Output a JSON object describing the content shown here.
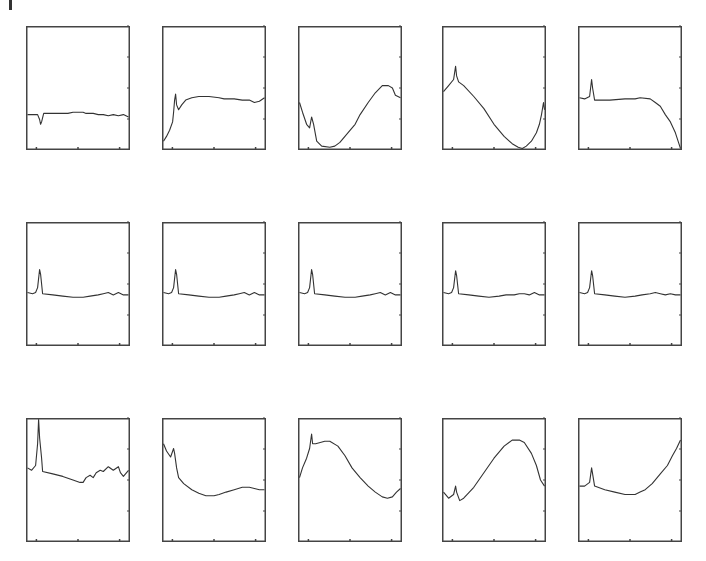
{
  "chart_data": {
    "type": "line",
    "title": "",
    "layout": {
      "rows": 3,
      "cols": 5,
      "grid": false,
      "legend": "none"
    },
    "xlabel": "",
    "ylabel": "",
    "xlim": [
      0,
      1
    ],
    "ylim": [
      0,
      1
    ],
    "x_ticks": [
      0.1,
      0.5,
      0.9
    ],
    "y_ticks_right": [
      0.25,
      0.5,
      0.75,
      1.0
    ],
    "line_color": "#333333",
    "frame_color": "#444444",
    "panels": [
      {
        "row": 0,
        "col": 0,
        "points": [
          [
            0,
            0.28
          ],
          [
            0.06,
            0.28
          ],
          [
            0.1,
            0.28
          ],
          [
            0.12,
            0.24
          ],
          [
            0.13,
            0.2
          ],
          [
            0.14,
            0.22
          ],
          [
            0.16,
            0.29
          ],
          [
            0.3,
            0.29
          ],
          [
            0.4,
            0.29
          ],
          [
            0.45,
            0.3
          ],
          [
            0.5,
            0.3
          ],
          [
            0.55,
            0.3
          ],
          [
            0.58,
            0.29
          ],
          [
            0.65,
            0.29
          ],
          [
            0.7,
            0.28
          ],
          [
            0.75,
            0.28
          ],
          [
            0.8,
            0.27
          ],
          [
            0.85,
            0.28
          ],
          [
            0.9,
            0.27
          ],
          [
            0.95,
            0.28
          ],
          [
            1,
            0.26
          ]
        ]
      },
      {
        "row": 0,
        "col": 1,
        "points": [
          [
            0,
            0.06
          ],
          [
            0.03,
            0.1
          ],
          [
            0.06,
            0.15
          ],
          [
            0.09,
            0.22
          ],
          [
            0.1,
            0.3
          ],
          [
            0.11,
            0.4
          ],
          [
            0.12,
            0.45
          ],
          [
            0.13,
            0.36
          ],
          [
            0.15,
            0.32
          ],
          [
            0.18,
            0.36
          ],
          [
            0.22,
            0.4
          ],
          [
            0.28,
            0.42
          ],
          [
            0.35,
            0.43
          ],
          [
            0.45,
            0.43
          ],
          [
            0.55,
            0.42
          ],
          [
            0.6,
            0.41
          ],
          [
            0.7,
            0.41
          ],
          [
            0.78,
            0.4
          ],
          [
            0.85,
            0.4
          ],
          [
            0.9,
            0.38
          ],
          [
            0.95,
            0.39
          ],
          [
            1,
            0.42
          ]
        ]
      },
      {
        "row": 0,
        "col": 2,
        "points": [
          [
            0,
            0.38
          ],
          [
            0.03,
            0.3
          ],
          [
            0.07,
            0.2
          ],
          [
            0.1,
            0.17
          ],
          [
            0.12,
            0.26
          ],
          [
            0.14,
            0.2
          ],
          [
            0.17,
            0.06
          ],
          [
            0.22,
            0.02
          ],
          [
            0.3,
            0.01
          ],
          [
            0.35,
            0.02
          ],
          [
            0.4,
            0.05
          ],
          [
            0.5,
            0.15
          ],
          [
            0.55,
            0.2
          ],
          [
            0.6,
            0.28
          ],
          [
            0.68,
            0.38
          ],
          [
            0.75,
            0.46
          ],
          [
            0.82,
            0.52
          ],
          [
            0.88,
            0.52
          ],
          [
            0.92,
            0.5
          ],
          [
            0.95,
            0.44
          ],
          [
            1,
            0.42
          ]
        ]
      },
      {
        "row": 0,
        "col": 3,
        "points": [
          [
            0,
            0.47
          ],
          [
            0.05,
            0.52
          ],
          [
            0.1,
            0.57
          ],
          [
            0.12,
            0.68
          ],
          [
            0.13,
            0.6
          ],
          [
            0.15,
            0.55
          ],
          [
            0.2,
            0.52
          ],
          [
            0.3,
            0.43
          ],
          [
            0.4,
            0.33
          ],
          [
            0.5,
            0.2
          ],
          [
            0.6,
            0.1
          ],
          [
            0.68,
            0.04
          ],
          [
            0.74,
            0.01
          ],
          [
            0.78,
            0.0
          ],
          [
            0.82,
            0.02
          ],
          [
            0.87,
            0.06
          ],
          [
            0.92,
            0.13
          ],
          [
            0.95,
            0.2
          ],
          [
            0.97,
            0.28
          ],
          [
            0.99,
            0.38
          ],
          [
            1,
            0.32
          ]
        ]
      },
      {
        "row": 0,
        "col": 4,
        "points": [
          [
            0,
            0.42
          ],
          [
            0.05,
            0.41
          ],
          [
            0.1,
            0.43
          ],
          [
            0.12,
            0.57
          ],
          [
            0.13,
            0.5
          ],
          [
            0.15,
            0.4
          ],
          [
            0.3,
            0.4
          ],
          [
            0.45,
            0.41
          ],
          [
            0.55,
            0.41
          ],
          [
            0.6,
            0.42
          ],
          [
            0.7,
            0.41
          ],
          [
            0.75,
            0.38
          ],
          [
            0.8,
            0.35
          ],
          [
            0.85,
            0.28
          ],
          [
            0.9,
            0.22
          ],
          [
            0.95,
            0.13
          ],
          [
            0.98,
            0.05
          ],
          [
            1,
            0.0
          ]
        ]
      },
      {
        "row": 1,
        "col": 0,
        "points": [
          [
            0,
            0.43
          ],
          [
            0.05,
            0.42
          ],
          [
            0.08,
            0.43
          ],
          [
            0.1,
            0.47
          ],
          [
            0.12,
            0.62
          ],
          [
            0.13,
            0.58
          ],
          [
            0.15,
            0.42
          ],
          [
            0.25,
            0.41
          ],
          [
            0.35,
            0.4
          ],
          [
            0.45,
            0.39
          ],
          [
            0.55,
            0.39
          ],
          [
            0.62,
            0.4
          ],
          [
            0.7,
            0.41
          ],
          [
            0.75,
            0.42
          ],
          [
            0.8,
            0.43
          ],
          [
            0.85,
            0.41
          ],
          [
            0.9,
            0.43
          ],
          [
            0.95,
            0.41
          ],
          [
            1,
            0.41
          ]
        ]
      },
      {
        "row": 1,
        "col": 1,
        "points": [
          [
            0,
            0.43
          ],
          [
            0.05,
            0.42
          ],
          [
            0.08,
            0.43
          ],
          [
            0.1,
            0.47
          ],
          [
            0.12,
            0.62
          ],
          [
            0.13,
            0.58
          ],
          [
            0.15,
            0.42
          ],
          [
            0.25,
            0.41
          ],
          [
            0.35,
            0.4
          ],
          [
            0.45,
            0.39
          ],
          [
            0.55,
            0.39
          ],
          [
            0.62,
            0.4
          ],
          [
            0.7,
            0.41
          ],
          [
            0.75,
            0.42
          ],
          [
            0.8,
            0.43
          ],
          [
            0.85,
            0.41
          ],
          [
            0.9,
            0.43
          ],
          [
            0.95,
            0.41
          ],
          [
            1,
            0.41
          ]
        ]
      },
      {
        "row": 1,
        "col": 2,
        "points": [
          [
            0,
            0.43
          ],
          [
            0.05,
            0.42
          ],
          [
            0.08,
            0.43
          ],
          [
            0.1,
            0.47
          ],
          [
            0.12,
            0.62
          ],
          [
            0.13,
            0.58
          ],
          [
            0.15,
            0.42
          ],
          [
            0.25,
            0.41
          ],
          [
            0.35,
            0.4
          ],
          [
            0.45,
            0.39
          ],
          [
            0.55,
            0.39
          ],
          [
            0.62,
            0.4
          ],
          [
            0.7,
            0.41
          ],
          [
            0.75,
            0.42
          ],
          [
            0.8,
            0.43
          ],
          [
            0.85,
            0.41
          ],
          [
            0.9,
            0.43
          ],
          [
            0.95,
            0.41
          ],
          [
            1,
            0.41
          ]
        ]
      },
      {
        "row": 1,
        "col": 3,
        "points": [
          [
            0,
            0.43
          ],
          [
            0.05,
            0.42
          ],
          [
            0.08,
            0.43
          ],
          [
            0.1,
            0.47
          ],
          [
            0.12,
            0.61
          ],
          [
            0.13,
            0.57
          ],
          [
            0.15,
            0.42
          ],
          [
            0.25,
            0.41
          ],
          [
            0.35,
            0.4
          ],
          [
            0.45,
            0.39
          ],
          [
            0.55,
            0.4
          ],
          [
            0.62,
            0.41
          ],
          [
            0.7,
            0.41
          ],
          [
            0.75,
            0.42
          ],
          [
            0.8,
            0.42
          ],
          [
            0.85,
            0.41
          ],
          [
            0.9,
            0.43
          ],
          [
            0.95,
            0.41
          ],
          [
            1,
            0.41
          ]
        ]
      },
      {
        "row": 1,
        "col": 4,
        "points": [
          [
            0,
            0.43
          ],
          [
            0.05,
            0.42
          ],
          [
            0.08,
            0.43
          ],
          [
            0.1,
            0.47
          ],
          [
            0.12,
            0.61
          ],
          [
            0.13,
            0.57
          ],
          [
            0.15,
            0.42
          ],
          [
            0.25,
            0.41
          ],
          [
            0.35,
            0.4
          ],
          [
            0.45,
            0.39
          ],
          [
            0.55,
            0.4
          ],
          [
            0.62,
            0.41
          ],
          [
            0.7,
            0.42
          ],
          [
            0.75,
            0.43
          ],
          [
            0.8,
            0.42
          ],
          [
            0.85,
            0.41
          ],
          [
            0.9,
            0.42
          ],
          [
            0.95,
            0.41
          ],
          [
            1,
            0.41
          ]
        ]
      },
      {
        "row": 2,
        "col": 0,
        "points": [
          [
            0,
            0.6
          ],
          [
            0.04,
            0.58
          ],
          [
            0.08,
            0.62
          ],
          [
            0.1,
            0.8
          ],
          [
            0.11,
            1.0
          ],
          [
            0.12,
            0.85
          ],
          [
            0.14,
            0.68
          ],
          [
            0.15,
            0.57
          ],
          [
            0.25,
            0.55
          ],
          [
            0.35,
            0.53
          ],
          [
            0.45,
            0.5
          ],
          [
            0.52,
            0.48
          ],
          [
            0.55,
            0.48
          ],
          [
            0.58,
            0.52
          ],
          [
            0.62,
            0.54
          ],
          [
            0.65,
            0.52
          ],
          [
            0.68,
            0.56
          ],
          [
            0.72,
            0.58
          ],
          [
            0.75,
            0.57
          ],
          [
            0.8,
            0.61
          ],
          [
            0.85,
            0.58
          ],
          [
            0.9,
            0.61
          ],
          [
            0.92,
            0.56
          ],
          [
            0.95,
            0.53
          ],
          [
            1,
            0.58
          ]
        ]
      },
      {
        "row": 2,
        "col": 1,
        "points": [
          [
            0,
            0.8
          ],
          [
            0.03,
            0.74
          ],
          [
            0.07,
            0.69
          ],
          [
            0.1,
            0.76
          ],
          [
            0.11,
            0.72
          ],
          [
            0.13,
            0.6
          ],
          [
            0.15,
            0.52
          ],
          [
            0.2,
            0.47
          ],
          [
            0.28,
            0.42
          ],
          [
            0.35,
            0.39
          ],
          [
            0.42,
            0.37
          ],
          [
            0.5,
            0.37
          ],
          [
            0.55,
            0.38
          ],
          [
            0.62,
            0.4
          ],
          [
            0.7,
            0.42
          ],
          [
            0.78,
            0.44
          ],
          [
            0.85,
            0.44
          ],
          [
            0.9,
            0.43
          ],
          [
            0.95,
            0.42
          ],
          [
            1,
            0.42
          ]
        ]
      },
      {
        "row": 2,
        "col": 2,
        "points": [
          [
            0,
            0.52
          ],
          [
            0.03,
            0.6
          ],
          [
            0.07,
            0.68
          ],
          [
            0.1,
            0.76
          ],
          [
            0.12,
            0.88
          ],
          [
            0.13,
            0.8
          ],
          [
            0.16,
            0.8
          ],
          [
            0.25,
            0.82
          ],
          [
            0.3,
            0.82
          ],
          [
            0.38,
            0.78
          ],
          [
            0.45,
            0.7
          ],
          [
            0.52,
            0.6
          ],
          [
            0.6,
            0.52
          ],
          [
            0.68,
            0.45
          ],
          [
            0.75,
            0.4
          ],
          [
            0.82,
            0.36
          ],
          [
            0.87,
            0.35
          ],
          [
            0.92,
            0.36
          ],
          [
            0.96,
            0.4
          ],
          [
            1,
            0.43
          ]
        ]
      },
      {
        "row": 2,
        "col": 3,
        "points": [
          [
            0,
            0.4
          ],
          [
            0.05,
            0.35
          ],
          [
            0.1,
            0.38
          ],
          [
            0.12,
            0.45
          ],
          [
            0.13,
            0.4
          ],
          [
            0.16,
            0.33
          ],
          [
            0.2,
            0.35
          ],
          [
            0.3,
            0.44
          ],
          [
            0.4,
            0.56
          ],
          [
            0.5,
            0.68
          ],
          [
            0.6,
            0.78
          ],
          [
            0.68,
            0.83
          ],
          [
            0.75,
            0.83
          ],
          [
            0.8,
            0.81
          ],
          [
            0.87,
            0.72
          ],
          [
            0.92,
            0.62
          ],
          [
            0.96,
            0.5
          ],
          [
            1,
            0.45
          ]
        ]
      },
      {
        "row": 2,
        "col": 4,
        "points": [
          [
            0,
            0.45
          ],
          [
            0.05,
            0.45
          ],
          [
            0.1,
            0.48
          ],
          [
            0.12,
            0.6
          ],
          [
            0.13,
            0.55
          ],
          [
            0.15,
            0.45
          ],
          [
            0.25,
            0.42
          ],
          [
            0.35,
            0.4
          ],
          [
            0.45,
            0.38
          ],
          [
            0.55,
            0.38
          ],
          [
            0.6,
            0.4
          ],
          [
            0.65,
            0.42
          ],
          [
            0.72,
            0.47
          ],
          [
            0.8,
            0.55
          ],
          [
            0.87,
            0.62
          ],
          [
            0.92,
            0.7
          ],
          [
            0.96,
            0.76
          ],
          [
            1,
            0.83
          ]
        ]
      }
    ]
  },
  "figure": {
    "panel_width": 104,
    "panel_height": 124,
    "col_lefts": [
      26,
      162,
      298,
      442,
      578
    ],
    "row_tops": [
      26,
      222,
      418
    ]
  }
}
